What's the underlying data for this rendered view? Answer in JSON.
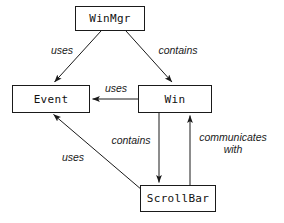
{
  "diagram": {
    "type": "object-interaction-diagram",
    "title": "",
    "background_color": "#ffffff",
    "line_color": "#1a1a1a",
    "text_color": "#111111",
    "nodes": [
      {
        "id": "winmgr",
        "label": "WinMgr",
        "x": 75,
        "y": 6,
        "w": 70,
        "h": 25
      },
      {
        "id": "event",
        "label": "Event",
        "x": 12,
        "y": 85,
        "w": 78,
        "h": 28
      },
      {
        "id": "win",
        "label": "Win",
        "x": 138,
        "y": 85,
        "w": 74,
        "h": 28
      },
      {
        "id": "scrollbar",
        "label": "ScrollBar",
        "x": 140,
        "y": 185,
        "w": 76,
        "h": 27
      }
    ],
    "edges": [
      {
        "id": "winmgr-event",
        "from": "winmgr",
        "to": "event",
        "label": "uses",
        "direction": "down-left"
      },
      {
        "id": "winmgr-win",
        "from": "winmgr",
        "to": "win",
        "label": "contains",
        "direction": "down-right"
      },
      {
        "id": "win-event",
        "from": "win",
        "to": "event",
        "label": "uses",
        "direction": "left"
      },
      {
        "id": "win-scrollbar",
        "from": "win",
        "to": "scrollbar",
        "label": "contains",
        "direction": "down"
      },
      {
        "id": "scrollbar-win",
        "from": "scrollbar",
        "to": "win",
        "label": "communicates with",
        "direction": "up"
      },
      {
        "id": "scrollbar-event",
        "from": "scrollbar",
        "to": "event",
        "label": "uses",
        "direction": "up-left"
      }
    ],
    "labels": [
      {
        "id": "label-uses-top-left",
        "text": "uses",
        "x": 44,
        "y": 44,
        "w": 36,
        "lines": 1
      },
      {
        "id": "label-contains-top",
        "text": "contains",
        "x": 150,
        "y": 44,
        "w": 56,
        "lines": 1
      },
      {
        "id": "label-uses-middle",
        "text": "uses",
        "x": 99,
        "y": 82,
        "w": 34,
        "lines": 1
      },
      {
        "id": "label-contains-middle",
        "text": "contains",
        "x": 104,
        "y": 134,
        "w": 54,
        "lines": 1
      },
      {
        "id": "label-communicates-with",
        "text": "communicates with",
        "x": 194,
        "y": 131,
        "w": 78,
        "lines": 2
      },
      {
        "id": "label-uses-bottom-left",
        "text": "uses",
        "x": 56,
        "y": 151,
        "w": 34,
        "lines": 1
      }
    ]
  }
}
